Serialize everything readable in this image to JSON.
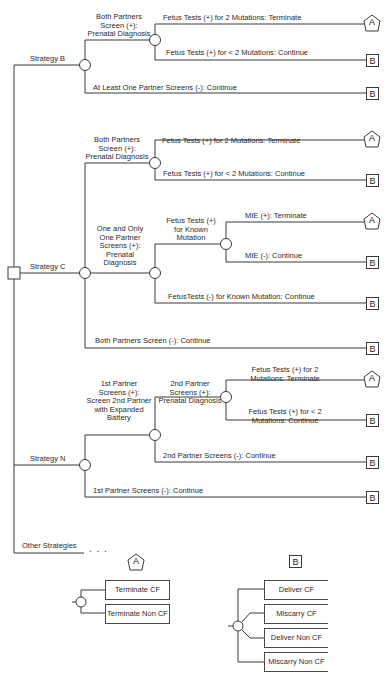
{
  "diagram": {
    "title": "",
    "root": {
      "type": "decision",
      "label": ""
    },
    "strategies": [
      {
        "label": "Strategy B",
        "branches": [
          {
            "label": "Both Partners Screen (+): Prenatal Diagnosis",
            "lines": [
              "Both Partners",
              "Screen (+):",
              "Prenatal Diagnosis"
            ],
            "branches": [
              {
                "label": "Fetus Tests (+) for  2 Mutations: Terminate",
                "terminal": "A"
              },
              {
                "label": "Fetus Tests (+) for < 2 Mutations: Continue",
                "terminal": "B"
              }
            ]
          },
          {
            "label": "At Least One Partner Screens (-): Continue",
            "terminal": "B"
          }
        ]
      },
      {
        "label": "Strategy C",
        "branches": [
          {
            "label": "Both Partners Screen (+): Prenatal Diagnosis",
            "lines": [
              "Both Partners",
              "Screen (+):",
              "Prenatal Diagnosis"
            ],
            "branches": [
              {
                "label": "Fetus Tests (+) for  2 Mutations: Terminate",
                "terminal": "A"
              },
              {
                "label": "Fetus Tests (+) for < 2 Mutations: Continue",
                "terminal": "B"
              }
            ]
          },
          {
            "label": "One and Only One Partner Screens (+): Prenatal Diagnosis",
            "lines": [
              "One and Only",
              "One Partner",
              "Screens (+):",
              "Prenatal",
              "Diagnosis"
            ],
            "branches": [
              {
                "label": "Fetus Tests (+) for  Known Mutation",
                "lines": [
                  "Fetus Tests (+)",
                  "for  Known",
                  "Mutation"
                ],
                "branches": [
                  {
                    "label": "MIE (+): Terminate",
                    "terminal": "A"
                  },
                  {
                    "label": "MIE (-): Continue",
                    "terminal": "B"
                  }
                ]
              },
              {
                "label": "FetusTests (-) for  Known Mutation: Continue",
                "terminal": "B"
              }
            ]
          },
          {
            "label": "Both Partners Screen (-): Continue",
            "terminal": "B"
          }
        ]
      },
      {
        "label": "Strategy  N",
        "branches": [
          {
            "label": "1st Partner Screens (+): Screen 2nd Partner with Expanded Battery",
            "lines": [
              "1st Partner",
              "Screens (+):",
              "Screen 2nd Partner",
              "with Expanded",
              "Battery"
            ],
            "branches": [
              {
                "label": "2nd Partner Screens (+): Prenatal Diagnosis",
                "lines": [
                  "2nd Partner",
                  "Screens (+):",
                  "Prenatal Diagnosis"
                ],
                "branches": [
                  {
                    "label": "Fetus Tests (+) for  2 Mutations: Terminate",
                    "lines": [
                      "Fetus Tests (+) for  2",
                      "Mutations: Terminate"
                    ],
                    "terminal": "A"
                  },
                  {
                    "label": "Fetus Tests (+) for  < 2 Mutations: Continue",
                    "lines": [
                      "Fetus Tests (+) for  < 2",
                      "Mutations: Continue"
                    ],
                    "terminal": "B"
                  }
                ]
              },
              {
                "label": "2nd Partner Screens (-): Continue",
                "terminal": "B"
              }
            ]
          },
          {
            "label": "1st Partner Screens (-): Continue",
            "terminal": "B"
          }
        ]
      },
      {
        "label": "Other Strategies",
        "ellipsis": ". . ."
      }
    ],
    "terminal_symbols": {
      "A": "A",
      "B": "B"
    },
    "legend": {
      "A": {
        "symbol": "A",
        "shape": "pentagon",
        "outcomes": [
          "Terminate CF",
          "Terminate Non CF"
        ]
      },
      "B": {
        "symbol": "B",
        "shape": "square",
        "outcomes": [
          "Deliver CF",
          "Miscarry CF",
          "Deliver Non CF",
          "Miscarry Non CF"
        ]
      }
    }
  }
}
